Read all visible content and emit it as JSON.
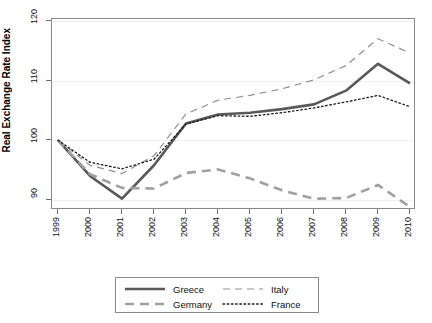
{
  "chart_data": {
    "type": "line",
    "title": "",
    "xlabel": "",
    "ylabel": "Real Exchange Rate Index",
    "x": [
      1999,
      2000,
      2001,
      2002,
      2003,
      2004,
      2005,
      2006,
      2007,
      2008,
      2009,
      2010
    ],
    "xticklabels": [
      "1999",
      "2000",
      "2001",
      "2002",
      "2003",
      "2004",
      "2005",
      "2006",
      "2007",
      "2008",
      "2009",
      "2010"
    ],
    "yticklabels": [
      "90",
      "100",
      "110",
      "120"
    ],
    "yticks": [
      90,
      100,
      110,
      120
    ],
    "ylim": [
      88.3,
      120.3
    ],
    "xlim": [
      1999,
      2010
    ],
    "grid": true,
    "legend_position": "below-center",
    "series": [
      {
        "name": "Greece",
        "style": "solid",
        "width": 2.6,
        "color": "#595959",
        "values": [
          100.0,
          94.0,
          90.2,
          95.8,
          102.8,
          104.3,
          104.6,
          105.2,
          106.0,
          108.3,
          112.8,
          109.5
        ]
      },
      {
        "name": "Germany",
        "style": "dashed",
        "width": 2.6,
        "color": "#a0a0a0",
        "values": [
          100.0,
          94.3,
          92.0,
          91.9,
          94.5,
          95.1,
          93.6,
          91.6,
          90.2,
          90.3,
          92.5,
          88.8
        ]
      },
      {
        "name": "Italy",
        "style": "longdash",
        "width": 1.2,
        "color": "#909090",
        "values": [
          100.0,
          95.8,
          94.4,
          97.4,
          104.4,
          106.7,
          107.5,
          108.6,
          110.1,
          112.5,
          117.0,
          114.6
        ]
      },
      {
        "name": "France",
        "style": "dotted",
        "width": 1.3,
        "color": "#1a1a1a",
        "values": [
          100.0,
          96.3,
          95.2,
          96.8,
          102.7,
          104.1,
          104.0,
          104.6,
          105.4,
          106.4,
          107.5,
          105.6
        ]
      }
    ]
  },
  "legend": {
    "entries": [
      {
        "label": "Greece"
      },
      {
        "label": "Germany"
      },
      {
        "label": "Italy"
      },
      {
        "label": "France"
      }
    ]
  }
}
